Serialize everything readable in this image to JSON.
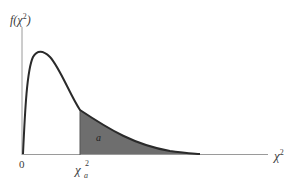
{
  "diagram": {
    "y_axis_label": "f(χ²)",
    "y_axis_label_parts": {
      "func": "f(",
      "var": "χ",
      "sup": "2",
      "close": ")"
    },
    "x_axis_label_parts": {
      "var": "χ",
      "sup": "2"
    },
    "origin_label": "0",
    "critical_value_label_parts": {
      "var": "χ",
      "sub": "a",
      "sup": "2"
    },
    "shaded_area_label": "a",
    "colors": {
      "curve": "#2a2a2a",
      "shade": "#6e6e6e",
      "axis": "#8a8a8a",
      "text": "#3a3a3a"
    }
  }
}
